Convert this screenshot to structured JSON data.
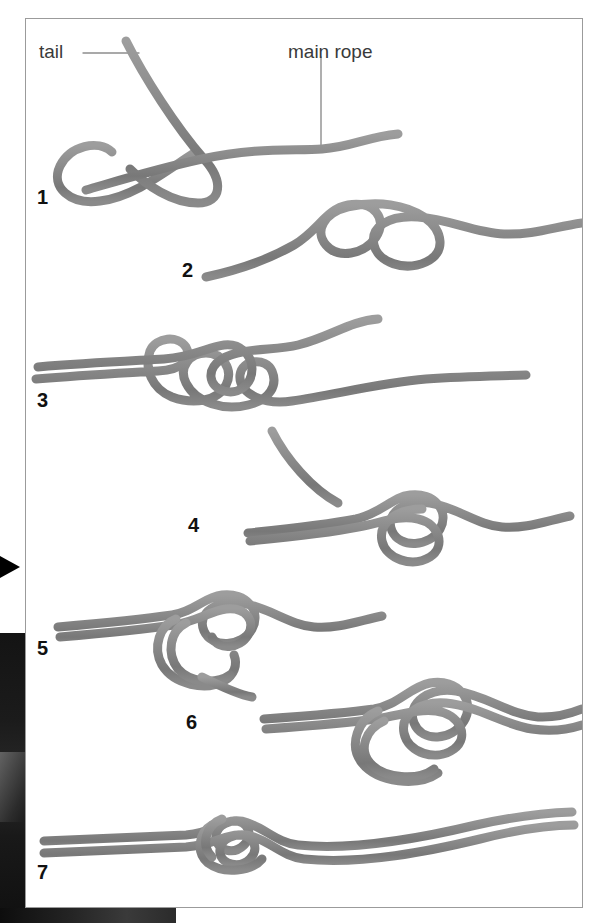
{
  "page": {
    "kind": "knot-tying-instruction-diagram",
    "background_color": "#ffffff",
    "panel_border_color": "#9b9b9b",
    "rope_color": "#8a8a8a",
    "rope_shadow_color": "#6f6f6f",
    "leader_line_color": "#8d8d8d",
    "label_text_color": "#3a3a3a",
    "number_text_color": "#111111"
  },
  "callouts": [
    {
      "id": "tail",
      "label": "tail"
    },
    {
      "id": "main_rope",
      "label": "main rope"
    }
  ],
  "steps": [
    {
      "number": "1"
    },
    {
      "number": "2"
    },
    {
      "number": "3"
    },
    {
      "number": "4"
    },
    {
      "number": "5"
    },
    {
      "number": "6"
    },
    {
      "number": "7"
    }
  ]
}
